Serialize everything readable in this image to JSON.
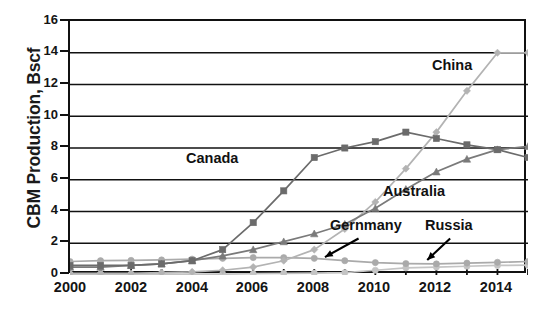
{
  "chart_data": {
    "type": "line",
    "title": "",
    "xlabel": "",
    "ylabel": "CBM Production, Bscf",
    "xlim": [
      2000,
      2015
    ],
    "ylim": [
      0,
      16
    ],
    "grid": true,
    "legend_position": "inline-annotations",
    "x": [
      2000,
      2001,
      2002,
      2003,
      2004,
      2005,
      2006,
      2007,
      2008,
      2009,
      2010,
      2011,
      2012,
      2013,
      2014,
      2015
    ],
    "xticks": [
      "2000",
      "2002",
      "2004",
      "2006",
      "2008",
      "2010",
      "2012",
      "2014"
    ],
    "xtick_values": [
      2000,
      2002,
      2004,
      2006,
      2008,
      2010,
      2012,
      2014
    ],
    "yticks": [
      "0",
      "2",
      "4",
      "6",
      "8",
      "10",
      "12",
      "14",
      "16"
    ],
    "ytick_values": [
      0,
      2,
      4,
      6,
      8,
      10,
      12,
      14,
      16
    ],
    "series": [
      {
        "name": "China",
        "color": "#b3b3b3",
        "marker": "diamond",
        "values": [
          0.1,
          0.1,
          0.1,
          0.15,
          0.2,
          0.3,
          0.5,
          0.9,
          1.6,
          2.9,
          4.6,
          6.7,
          9.0,
          11.6,
          14.0,
          14.0
        ]
      },
      {
        "name": "Canada",
        "color": "#6b6b6b",
        "marker": "square",
        "values": [
          0.6,
          0.6,
          0.6,
          0.7,
          0.9,
          1.6,
          3.3,
          5.3,
          7.4,
          8.0,
          8.4,
          9.0,
          8.6,
          8.2,
          7.9,
          7.4
        ]
      },
      {
        "name": "Australia",
        "color": "#7a7a7a",
        "marker": "triangle",
        "values": [
          0.5,
          0.5,
          0.6,
          0.7,
          0.9,
          1.2,
          1.6,
          2.1,
          2.6,
          3.2,
          4.2,
          5.4,
          6.5,
          7.3,
          7.9,
          8.1
        ]
      },
      {
        "name": "Gernmany",
        "color": "#aaaaaa",
        "marker": "circle",
        "values": [
          0.85,
          0.9,
          0.92,
          0.95,
          1.0,
          1.05,
          1.1,
          1.1,
          1.05,
          0.9,
          0.78,
          0.72,
          0.7,
          0.75,
          0.8,
          0.85
        ]
      },
      {
        "name": "Russia",
        "color": "#c4c4c4",
        "marker": "circle",
        "values": [
          0.05,
          0.05,
          0.05,
          0.05,
          0.05,
          0.05,
          0.08,
          0.1,
          0.12,
          0.15,
          0.3,
          0.45,
          0.5,
          0.55,
          0.6,
          0.62
        ]
      }
    ],
    "annotations": [
      {
        "label": "China",
        "x": 2012.9,
        "y": 12.2
      },
      {
        "label": "Canada",
        "x": 2004.0,
        "y": 6.6
      },
      {
        "label": "Australia",
        "x": 2011.3,
        "y": 4.6
      },
      {
        "label": "Gernmany",
        "x": 2009.5,
        "y": 2.5,
        "arrow": true
      },
      {
        "label": "Russia",
        "x": 2012.6,
        "y": 2.5,
        "arrow": true
      }
    ]
  },
  "axis": {
    "y_title": "CBM Production, Bscf",
    "y_ticks": [
      "16",
      "14",
      "12",
      "10",
      "8",
      "6",
      "4",
      "2",
      "0"
    ],
    "x_ticks": [
      "2000",
      "2002",
      "2004",
      "2006",
      "2008",
      "2010",
      "2012",
      "2014"
    ]
  },
  "labels": {
    "china": "China",
    "canada": "Canada",
    "australia": "Australia",
    "germany": "Gernmany",
    "russia": "Russia"
  }
}
